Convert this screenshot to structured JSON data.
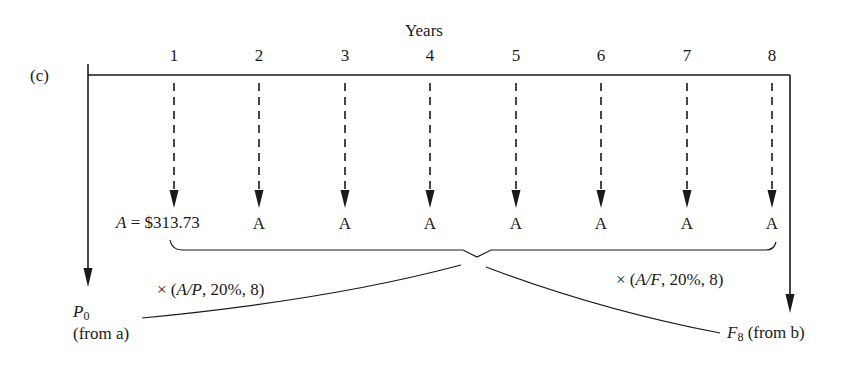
{
  "diagram": {
    "panel_label": "(c)",
    "axis_title": "Years",
    "years": [
      "1",
      "2",
      "3",
      "4",
      "5",
      "6",
      "7",
      "8"
    ],
    "year_x": [
      174,
      259,
      345,
      430,
      516,
      601,
      687,
      772
    ],
    "annuity": {
      "first_label_var": "A",
      "first_label_rest": " = $313.73",
      "repeat_label": "A"
    },
    "left_factor": "× (A/P, 20%, 8)",
    "left_factor_parts": {
      "prefix": "× (",
      "var": "A/P",
      "suffix": ", 20%, 8)"
    },
    "right_factor_parts": {
      "prefix": "× (",
      "var": "A/F",
      "suffix": ", 20%, 8)"
    },
    "present": {
      "var": "P",
      "sub": "0",
      "note": "(from  a)"
    },
    "future": {
      "var": "F",
      "sub": "8",
      "note": " (from b)"
    },
    "colors": {
      "line": "#1a1a1a",
      "background": "#ffffff"
    }
  }
}
